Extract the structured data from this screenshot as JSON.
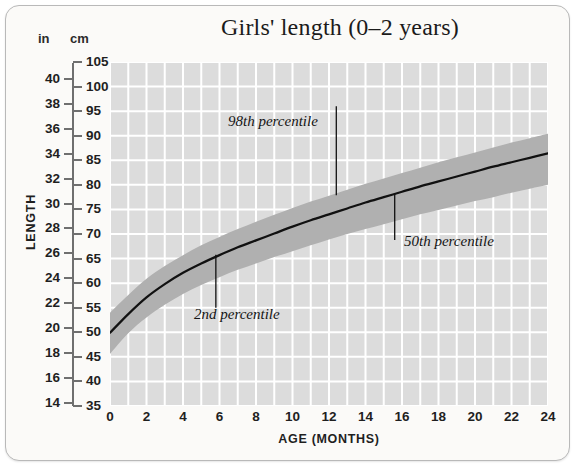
{
  "chart_title": "Girls' length (0–2 years)",
  "axes": {
    "y_unit_left": "in",
    "y_unit_right": "cm",
    "y_title": "LENGTH",
    "x_title": "AGE (MONTHS)"
  },
  "annotations": {
    "upper": "98th percentile",
    "lower": "2nd percentile",
    "median": "50th percentile"
  },
  "colors": {
    "plot_background": "#dcdcdc",
    "gridline": "#ffffff",
    "band_fill": "#b0b0b0",
    "median_line": "#111111",
    "card_background": "#fbfaf8",
    "card_border": "#b9b9b9",
    "axis": "#6f6f6f",
    "text": "#1f1f1f"
  },
  "chart_data": {
    "type": "area",
    "title": "Girls' length (0–2 years)",
    "xlabel": "AGE (MONTHS)",
    "ylabel": "LENGTH",
    "xlim": [
      0,
      24
    ],
    "ylim": [
      35,
      105
    ],
    "y_unit": "cm",
    "y_secondary_unit": "in",
    "grid": true,
    "legend_position": "none",
    "x_ticks": [
      0,
      2,
      4,
      6,
      8,
      10,
      12,
      14,
      16,
      18,
      20,
      22,
      24
    ],
    "x_minor_step": 1,
    "y_ticks_cm": [
      35,
      40,
      45,
      50,
      55,
      60,
      65,
      70,
      75,
      80,
      85,
      90,
      95,
      100,
      105
    ],
    "y_ticks_in": [
      14,
      16,
      18,
      20,
      22,
      24,
      26,
      28,
      30,
      32,
      34,
      36,
      38,
      40
    ],
    "x": [
      0,
      1,
      2,
      3,
      4,
      5,
      6,
      7,
      8,
      9,
      10,
      11,
      12,
      13,
      14,
      15,
      16,
      17,
      18,
      19,
      20,
      21,
      22,
      23,
      24
    ],
    "series": [
      {
        "name": "98th percentile",
        "values": [
          54.0,
          57.6,
          60.9,
          63.5,
          65.7,
          67.7,
          69.4,
          71.0,
          72.5,
          73.9,
          75.3,
          76.6,
          77.8,
          79.0,
          80.2,
          81.3,
          82.4,
          83.5,
          84.6,
          85.6,
          86.6,
          87.6,
          88.6,
          89.5,
          90.4
        ]
      },
      {
        "name": "50th percentile",
        "values": [
          49.9,
          53.7,
          57.1,
          59.8,
          62.1,
          64.0,
          65.7,
          67.3,
          68.7,
          70.1,
          71.5,
          72.8,
          74.0,
          75.2,
          76.4,
          77.5,
          78.6,
          79.7,
          80.7,
          81.7,
          82.7,
          83.7,
          84.6,
          85.5,
          86.4
        ]
      },
      {
        "name": "2nd percentile",
        "values": [
          45.6,
          49.8,
          53.0,
          55.6,
          57.8,
          59.6,
          61.2,
          62.7,
          64.0,
          65.3,
          66.5,
          67.7,
          68.9,
          70.0,
          71.0,
          72.0,
          73.0,
          74.0,
          74.9,
          75.8,
          76.7,
          77.5,
          78.4,
          79.2,
          80.0
        ]
      }
    ]
  }
}
